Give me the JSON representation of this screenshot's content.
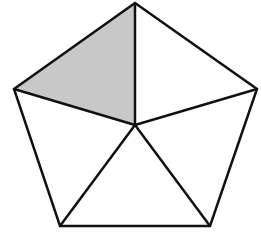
{
  "diagram": {
    "center": [
      135,
      125
    ],
    "vertices": [
      [
        135,
        3
      ],
      [
        257,
        89
      ],
      [
        210,
        226
      ],
      [
        60,
        226
      ],
      [
        14,
        89
      ]
    ],
    "shaded_triangle": {
      "vertices": [
        [
          135,
          3
        ],
        [
          14,
          89
        ],
        [
          135,
          125
        ]
      ],
      "fill": "#c8c8c8"
    },
    "stroke": "#111111",
    "stroke_width": 2.5
  }
}
